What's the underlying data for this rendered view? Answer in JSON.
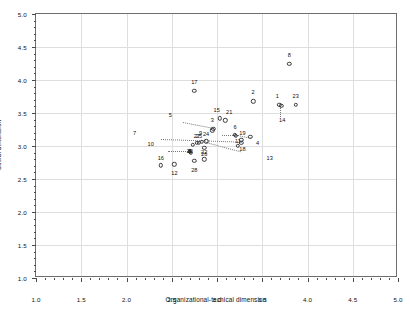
{
  "chart_data": {
    "type": "scatter",
    "title": "",
    "xlabel": "Organizational-techical dimension",
    "ylabel": "Social dimension",
    "xlim": [
      1.0,
      5.0
    ],
    "ylim": [
      1.0,
      5.0
    ],
    "xticks": [
      1.0,
      1.5,
      2.0,
      2.5,
      3.0,
      3.5,
      4.0,
      4.5,
      5.0
    ],
    "yticks": [
      1.0,
      1.5,
      2.0,
      2.5,
      3.0,
      3.5,
      4.0,
      4.5,
      5.0
    ],
    "xtick_labels": [
      "1.0",
      "1.5",
      "2.0",
      "2.5",
      "3.0",
      "3.5",
      "4.0",
      "4.5",
      "5.0"
    ],
    "ytick_labels": [
      "1.0",
      "1.5",
      "2.0",
      "2.5",
      "3.0",
      "3.5",
      "4.0",
      "4.5",
      "5.0"
    ],
    "grid": true,
    "grid_color": "#dedede",
    "legend": "none",
    "marker": "open-circle",
    "marker_color": "#3a3a3a",
    "points": [
      {
        "id": "1",
        "x": 3.69,
        "y": 3.62,
        "label_dx": -2,
        "label_dy": -9,
        "filled": false
      },
      {
        "id": "2",
        "x": 3.4,
        "y": 3.68,
        "label_dx": 0,
        "label_dy": -9,
        "filled": false
      },
      {
        "id": "3",
        "x": 2.96,
        "y": 3.26,
        "label_dx": -1,
        "label_dy": -9,
        "filled": false
      },
      {
        "id": "4",
        "x": 3.37,
        "y": 3.14,
        "label_dx": 7,
        "label_dy": 6,
        "filled": false
      },
      {
        "id": "5",
        "x": 2.95,
        "y": 3.24,
        "label_dx": -42,
        "label_dy": -15,
        "filled": false
      },
      {
        "id": "6",
        "x": 3.2,
        "y": 3.17,
        "label_dx": 0,
        "label_dy": -8,
        "filled": false
      },
      {
        "id": "7",
        "x": 2.73,
        "y": 3.02,
        "label_dx": -58,
        "label_dy": -12,
        "filled": false
      },
      {
        "id": "8",
        "x": 3.8,
        "y": 4.25,
        "label_dx": 0,
        "label_dy": -9,
        "filled": false
      },
      {
        "id": "9",
        "x": 2.83,
        "y": 3.06,
        "label_dx": -1,
        "label_dy": -9,
        "filled": false
      },
      {
        "id": "10",
        "x": 2.71,
        "y": 2.9,
        "label_dx": -40,
        "label_dy": -9,
        "filled": false
      },
      {
        "id": "11",
        "x": 3.21,
        "y": 3.15,
        "label_dx": 2,
        "label_dy": 5,
        "filled": false
      },
      {
        "id": "12",
        "x": 2.53,
        "y": 2.72,
        "label_dx": 0,
        "label_dy": 9,
        "filled": false
      },
      {
        "id": "13",
        "x": 3.23,
        "y": 3.0,
        "label_dx": 32,
        "label_dy": 12,
        "filled": false
      },
      {
        "id": "14",
        "x": 3.71,
        "y": 3.61,
        "label_dx": 1,
        "label_dy": 14,
        "filled": false
      },
      {
        "id": "15",
        "x": 3.03,
        "y": 3.42,
        "label_dx": -3,
        "label_dy": -8,
        "filled": false
      },
      {
        "id": "16",
        "x": 2.38,
        "y": 2.71,
        "label_dx": 0,
        "label_dy": -7,
        "filled": false
      },
      {
        "id": "17",
        "x": 2.75,
        "y": 3.84,
        "label_dx": 0,
        "label_dy": -9,
        "filled": false
      },
      {
        "id": "18",
        "x": 3.27,
        "y": 3.05,
        "label_dx": 1,
        "label_dy": 6,
        "filled": false
      },
      {
        "id": "19",
        "x": 3.27,
        "y": 3.09,
        "label_dx": 1,
        "label_dy": -7,
        "filled": false
      },
      {
        "id": "20",
        "x": 2.7,
        "y": 2.92,
        "label_dx": 0,
        "label_dy": 0,
        "filled": true
      },
      {
        "id": "21",
        "x": 3.09,
        "y": 3.39,
        "label_dx": 4,
        "label_dy": -8,
        "filled": false
      },
      {
        "id": "22",
        "x": 2.86,
        "y": 2.8,
        "label_dx": 0,
        "label_dy": -7,
        "filled": false
      },
      {
        "id": "23",
        "x": 3.87,
        "y": 3.62,
        "label_dx": 0,
        "label_dy": -9,
        "filled": false
      },
      {
        "id": "24",
        "x": 2.88,
        "y": 3.07,
        "label_dx": 0,
        "label_dy": -7,
        "filled": false
      },
      {
        "id": "25",
        "x": 2.8,
        "y": 3.05,
        "label_dx": 0,
        "label_dy": -7,
        "filled": false
      },
      {
        "id": "26",
        "x": 2.86,
        "y": 2.97,
        "label_dx": 0,
        "label_dy": 6,
        "filled": false
      },
      {
        "id": "27",
        "x": 2.78,
        "y": 3.05,
        "label_dx": 0,
        "label_dy": -7,
        "filled": false
      },
      {
        "id": "28",
        "x": 2.75,
        "y": 2.78,
        "label_dx": 0,
        "label_dy": 9,
        "filled": false
      }
    ],
    "leaders": [
      {
        "from_label": "5",
        "x1": 2.62,
        "y1": 3.36,
        "x2": 2.96,
        "y2": 3.27
      },
      {
        "from_label": "7",
        "x1": 2.38,
        "y1": 3.1,
        "x2": 3.27,
        "y2": 3.06
      },
      {
        "from_label": "10",
        "x1": 2.46,
        "y1": 2.92,
        "x2": 2.7,
        "y2": 2.92
      },
      {
        "from_label": "13",
        "x1": 2.88,
        "y1": 3.06,
        "x2": 3.26,
        "y2": 2.92
      },
      {
        "from_label": "14",
        "x1": 3.71,
        "y1": 3.61,
        "x2": 3.71,
        "y2": 3.44
      },
      {
        "from_label": "4",
        "x1": 3.22,
        "y1": 3.17,
        "x2": 3.37,
        "y2": 3.13
      },
      {
        "from_label": "6",
        "x1": 3.05,
        "y1": 3.16,
        "x2": 3.2,
        "y2": 3.16
      }
    ]
  }
}
